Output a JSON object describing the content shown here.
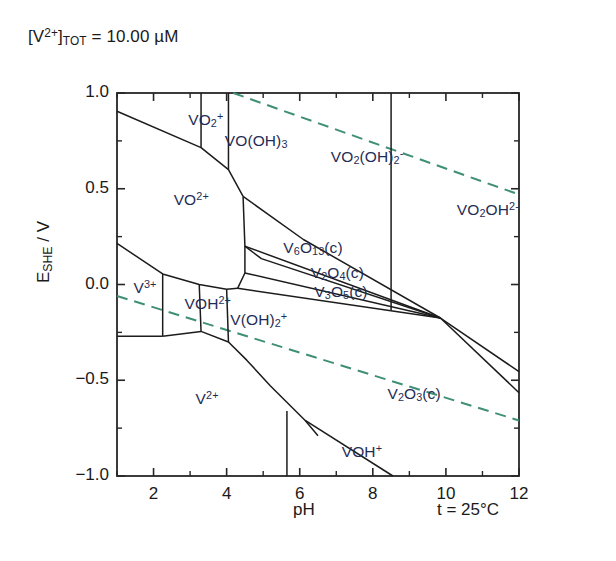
{
  "figure": {
    "annotation_concentration": "[V2+]TOT = 10.00 uM",
    "annotation_temperature": "t = 25°C"
  },
  "chart_data": {
    "type": "line",
    "subtype": "pourbaix-predominance-diagram",
    "xlabel": "pH",
    "ylabel": "ESHE / V",
    "xlim": [
      1,
      12
    ],
    "ylim": [
      -1.0,
      1.0
    ],
    "grid": false,
    "legend": "none",
    "x_major_ticks": [
      2,
      4,
      6,
      8,
      10,
      12
    ],
    "x_major_tick_labels": [
      "2",
      "4",
      "6",
      "8",
      "10",
      "12"
    ],
    "x_minor_ticks": [
      1,
      3,
      5,
      7,
      9,
      11
    ],
    "y_major_ticks": [
      -1.0,
      -0.5,
      0.0,
      0.5,
      1.0
    ],
    "y_major_tick_labels": [
      "-1.0",
      "-0.5",
      "0.0",
      "0.5",
      "1.0"
    ],
    "y_minor_ticks": [
      -0.75,
      -0.25,
      0.25,
      0.75
    ],
    "temperature": "t = 25°C",
    "field_labels": [
      {
        "text": "VO2+",
        "html": "VO<sub>2</sub><sup>+</sup>",
        "ph": 2.95,
        "e": 0.86
      },
      {
        "text": "VO(OH)3",
        "html": "VO(OH)<sub>3</sub>",
        "ph": 3.95,
        "e": 0.745
      },
      {
        "text": "VO2(OH)2-",
        "html": "VO<sub>2</sub>(OH)<sub>2</sub><sup>-</sup>",
        "ph": 6.85,
        "e": 0.665
      },
      {
        "text": "VO2OH2-",
        "html": "VO<sub>2</sub>OH<sup>2-</sup>",
        "ph": 10.3,
        "e": 0.39
      },
      {
        "text": "VO2+ (vanadyl)",
        "html": "VO<sup>2+</sup>",
        "ph": 2.55,
        "e": 0.44
      },
      {
        "text": "V6O13(c)",
        "html": "V<sub>6</sub>O<sub>13</sub>(c)",
        "ph": 5.55,
        "e": 0.185
      },
      {
        "text": "V2O4(c)",
        "html": "V<sub>2</sub>O<sub>4</sub>(c)",
        "ph": 6.3,
        "e": 0.055
      },
      {
        "text": "V3O5(c)",
        "html": "V<sub>3</sub>O<sub>5</sub>(c)",
        "ph": 6.4,
        "e": -0.045
      },
      {
        "text": "V3+",
        "html": "V<sup>3+</sup>",
        "ph": 1.45,
        "e": -0.02
      },
      {
        "text": "VOH2+",
        "html": "VOH<sup>2+</sup>",
        "ph": 2.85,
        "e": -0.1
      },
      {
        "text": "V(OH)2+",
        "html": "V(OH)<sub>2</sub><sup>+</sup>",
        "ph": 4.1,
        "e": -0.185
      },
      {
        "text": "V2+",
        "html": "V<sup>2+</sup>",
        "ph": 3.15,
        "e": -0.6
      },
      {
        "text": "V2O3(c)",
        "html": "V<sub>2</sub>O<sub>3</sub>(c)",
        "ph": 8.4,
        "e": -0.575
      },
      {
        "text": "VOH+",
        "html": "VOH<sup>+</sup>",
        "ph": 7.15,
        "e": -0.875
      }
    ],
    "water_stability_lines": [
      {
        "name": "oxygen-line",
        "style": "dashed",
        "color": "#3f8f77",
        "points": [
          [
            4.18,
            1.0
          ],
          [
            12.0,
            0.47
          ]
        ]
      },
      {
        "name": "hydrogen-line",
        "style": "dashed",
        "color": "#3f8f77",
        "points": [
          [
            1.0,
            -0.06
          ],
          [
            12.0,
            -0.71
          ]
        ]
      }
    ],
    "boundaries": [
      {
        "name": "VO2+/VO2+ upper",
        "points": [
          [
            1.0,
            0.905
          ],
          [
            3.3,
            0.715
          ],
          [
            4.05,
            0.6
          ],
          [
            4.45,
            0.46
          ]
        ]
      },
      {
        "name": "vertical-pH-3.3",
        "points": [
          [
            3.3,
            1.0
          ],
          [
            3.3,
            0.715
          ]
        ]
      },
      {
        "name": "vertical-pH-4.05",
        "points": [
          [
            4.05,
            1.0
          ],
          [
            4.05,
            0.6
          ]
        ]
      },
      {
        "name": "VO2(OH)2-/oxides",
        "points": [
          [
            4.45,
            0.46
          ],
          [
            6.1,
            0.235
          ],
          [
            9.85,
            -0.175
          ]
        ]
      },
      {
        "name": "vertical-pH-8.5",
        "points": [
          [
            8.5,
            1.0
          ],
          [
            8.5,
            -0.135
          ]
        ]
      },
      {
        "name": "V6O13-lower",
        "points": [
          [
            4.45,
            0.46
          ],
          [
            4.5,
            0.2
          ],
          [
            9.85,
            -0.175
          ]
        ]
      },
      {
        "name": "V6O13/V2O4",
        "points": [
          [
            4.5,
            0.2
          ],
          [
            4.95,
            0.135
          ],
          [
            9.85,
            -0.175
          ]
        ]
      },
      {
        "name": "V2O4/V3O5",
        "points": [
          [
            4.5,
            0.06
          ],
          [
            9.85,
            -0.175
          ]
        ]
      },
      {
        "name": "V2O4-left",
        "points": [
          [
            4.5,
            0.2
          ],
          [
            4.5,
            0.06
          ]
        ]
      },
      {
        "name": "V3O5-lower",
        "points": [
          [
            4.5,
            0.06
          ],
          [
            4.3,
            -0.02
          ],
          [
            9.85,
            -0.175
          ]
        ]
      },
      {
        "name": "oxides-to-V2O3",
        "points": [
          [
            9.85,
            -0.175
          ],
          [
            12.0,
            -0.565
          ]
        ]
      },
      {
        "name": "V3O5/V2O3",
        "points": [
          [
            9.85,
            -0.175
          ],
          [
            12.0,
            -0.455
          ]
        ]
      },
      {
        "name": "V3+/VO2+ boundary",
        "points": [
          [
            1.0,
            0.215
          ],
          [
            2.25,
            0.055
          ],
          [
            3.25,
            0.0
          ],
          [
            4.0,
            -0.025
          ],
          [
            4.3,
            -0.02
          ]
        ]
      },
      {
        "name": "V3+/VOH2+ vertical",
        "points": [
          [
            2.25,
            0.055
          ],
          [
            2.25,
            -0.27
          ]
        ]
      },
      {
        "name": "VOH2+/V(OH)2+ vertical",
        "points": [
          [
            3.25,
            0.0
          ],
          [
            3.3,
            -0.245
          ]
        ]
      },
      {
        "name": "V(OH)2+-right vertical",
        "points": [
          [
            4.0,
            -0.025
          ],
          [
            4.05,
            -0.3
          ]
        ]
      },
      {
        "name": "V3+/V2+ horizontal",
        "points": [
          [
            1.0,
            -0.27
          ],
          [
            2.25,
            -0.27
          ]
        ]
      },
      {
        "name": "VOH2+/V2+ boundary",
        "points": [
          [
            2.25,
            -0.27
          ],
          [
            3.3,
            -0.245
          ]
        ]
      },
      {
        "name": "V2+/upper boundary",
        "points": [
          [
            3.3,
            -0.245
          ],
          [
            4.05,
            -0.3
          ],
          [
            4.55,
            -0.395
          ],
          [
            5.2,
            -0.53
          ],
          [
            6.15,
            -0.71
          ],
          [
            6.5,
            -0.79
          ]
        ]
      },
      {
        "name": "V2+/VOH+ vertical",
        "points": [
          [
            5.65,
            -0.66
          ],
          [
            5.65,
            -1.0
          ]
        ]
      },
      {
        "name": "VOH+/V2O3 boundary",
        "points": [
          [
            6.15,
            -0.71
          ],
          [
            8.55,
            -1.0
          ]
        ]
      }
    ]
  }
}
